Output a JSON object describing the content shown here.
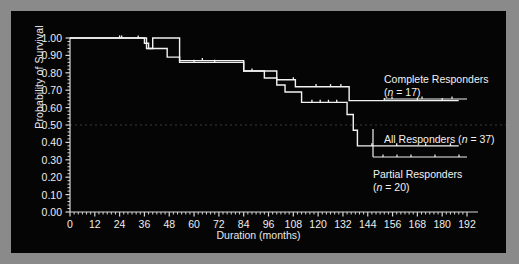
{
  "figure": {
    "background_color": "#8a8a8a",
    "panel_color": "#050505",
    "line_color": "#f2f2f2",
    "axis_color": "#d8d8d8",
    "grid_color": "#3a3a3a"
  },
  "axes": {
    "ylabel": "Probability of Survival",
    "xlabel": "Duration (months)",
    "yticks": [
      "0.00",
      "0.10",
      "0.20",
      "0.30",
      "0.40",
      "0.50",
      "0.60",
      "0.70",
      "0.80",
      "0.90",
      "1.00"
    ],
    "xticks": [
      "0",
      "12",
      "24",
      "36",
      "48",
      "60",
      "72",
      "84",
      "96",
      "108",
      "120",
      "132",
      "144",
      "156",
      "168",
      "180",
      "192"
    ]
  },
  "annotations": {
    "complete": {
      "line1": "Complete Responders",
      "line2_pre": "(",
      "line2_n": "n",
      "line2_post": " = 17)"
    },
    "all": {
      "pre": "All Responders (",
      "n": "n",
      "post": " = 37)"
    },
    "partial": {
      "line1": "Partial Responders",
      "line2_pre": "(",
      "line2_n": "n",
      "line2_post": " = 20)"
    }
  },
  "chart_data": {
    "type": "line",
    "title": "",
    "xlabel": "Duration (months)",
    "ylabel": "Probability of Survival",
    "xlim": [
      0,
      192
    ],
    "ylim": [
      0,
      1
    ],
    "grid": false,
    "legend_position": "inline-annotations",
    "style": "Kaplan-Meier step survival curves",
    "series": [
      {
        "name": "Complete Responders",
        "n": 17,
        "label": "Complete Responders (n = 17)",
        "steps": [
          [
            0,
            1.0
          ],
          [
            37,
            1.0
          ],
          [
            37,
            0.94
          ],
          [
            40,
            0.94
          ],
          [
            40,
            1.0
          ],
          [
            53,
            1.0
          ],
          [
            53,
            0.87
          ],
          [
            84,
            0.87
          ],
          [
            84,
            0.81
          ],
          [
            100,
            0.81
          ],
          [
            100,
            0.76
          ],
          [
            109,
            0.76
          ],
          [
            109,
            0.72
          ],
          [
            135,
            0.72
          ],
          [
            135,
            0.64
          ],
          [
            188,
            0.64
          ]
        ],
        "censor_marks": [
          24,
          33,
          64,
          88,
          108,
          119,
          126,
          131,
          152,
          168,
          180
        ],
        "final_value": 0.64
      },
      {
        "name": "All Responders",
        "n": 37,
        "label": "All Responders (n = 37)",
        "steps": [
          [
            0,
            1.0
          ],
          [
            36,
            1.0
          ],
          [
            36,
            0.97
          ],
          [
            38,
            0.97
          ],
          [
            38,
            0.94
          ],
          [
            47,
            0.94
          ],
          [
            47,
            0.89
          ],
          [
            53,
            0.89
          ],
          [
            53,
            0.86
          ],
          [
            84,
            0.86
          ],
          [
            84,
            0.81
          ],
          [
            94,
            0.81
          ],
          [
            94,
            0.77
          ],
          [
            100,
            0.77
          ],
          [
            100,
            0.73
          ],
          [
            104,
            0.73
          ],
          [
            104,
            0.69
          ],
          [
            112,
            0.69
          ],
          [
            112,
            0.63
          ],
          [
            134,
            0.63
          ],
          [
            134,
            0.56
          ],
          [
            137,
            0.56
          ],
          [
            137,
            0.47
          ],
          [
            139,
            0.47
          ],
          [
            139,
            0.38
          ],
          [
            188,
            0.38
          ]
        ],
        "censor_marks": [
          25,
          60,
          70,
          117,
          121,
          125,
          129,
          146,
          158,
          172,
          184
        ],
        "final_value": 0.38
      }
    ],
    "reference_lines": [
      {
        "y": 0.5,
        "style": "dotted",
        "color": "#3a3a3a"
      }
    ]
  }
}
